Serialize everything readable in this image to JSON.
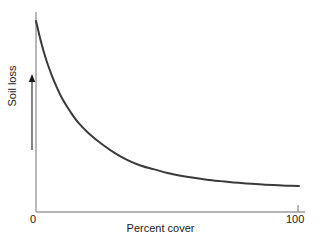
{
  "chart_data": {
    "type": "line",
    "title": "",
    "xlabel": "Percent cover",
    "ylabel": "Soil loss",
    "xlim": [
      0,
      100
    ],
    "ylim": [
      0,
      100
    ],
    "grid": false,
    "legend": null,
    "xticks": [
      {
        "value": 0,
        "label": "0"
      },
      {
        "value": 100,
        "label": "100"
      }
    ],
    "yticks": [],
    "annotations": [
      {
        "name": "y-axis-direction-arrow",
        "text": "",
        "meaning": "upward arrow beside y-axis label indicating increasing soil loss"
      }
    ],
    "series": [
      {
        "name": "Soil loss vs percent cover",
        "color": "#3a3a3a",
        "linewidth": 2,
        "x": [
          0,
          2,
          4,
          6,
          8,
          10,
          13,
          16,
          20,
          25,
          30,
          35,
          40,
          45,
          50,
          55,
          60,
          65,
          70,
          75,
          80,
          85,
          90,
          95,
          100
        ],
        "y": [
          100,
          88,
          78,
          70,
          63,
          57,
          50,
          44,
          38,
          32,
          27,
          23,
          20,
          18,
          16,
          14.5,
          13.3,
          12.3,
          11.5,
          10.8,
          10.2,
          9.7,
          9.3,
          9.0,
          8.8
        ]
      }
    ]
  },
  "axes": {
    "axis_color": "#9a9a9a",
    "curve_color": "#3a3a3a",
    "text_color": "#1a1a1a",
    "background": "#ffffff"
  },
  "labels": {
    "xaxis_title": "Percent cover",
    "yaxis_title": "Soil loss",
    "xtick_0": "0",
    "xtick_100": "100"
  }
}
